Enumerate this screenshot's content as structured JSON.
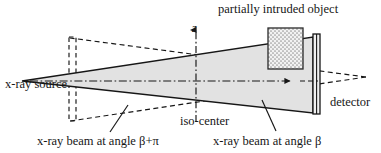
{
  "figure": {
    "width": 381,
    "height": 153,
    "background": "#ffffff",
    "stroke_color": "#161616",
    "fan_fill": "#e2e2e2",
    "object_fill": "#e6e6e6"
  },
  "labels": {
    "object": "partially intruded object",
    "source": "x-ray source",
    "detector": "detector",
    "iso_center": "iso-center",
    "beam_beta_plus_pi": "x-ray beam at angle β+π",
    "beam_beta": "x-ray beam at angle β",
    "z_axis": "z"
  },
  "geometry": {
    "source_point": [
      22,
      81
    ],
    "iso_center": [
      196,
      81
    ],
    "detector_bar": {
      "x": 313,
      "y": 34,
      "width": 7,
      "height": 80
    },
    "ghost_detector_bar": {
      "x": 69,
      "y": 37,
      "width": 7,
      "height": 84
    },
    "object_rect": {
      "x": 268,
      "y": 28,
      "width": 35,
      "height": 41
    },
    "fan_beta": {
      "apex": [
        22,
        81
      ],
      "top_far": [
        313,
        37
      ],
      "bottom_far": [
        313,
        113
      ]
    },
    "fan_beta_plus_pi": {
      "apex": [
        366,
        77
      ],
      "top_near": [
        70,
        38
      ],
      "bottom_near": [
        70,
        121
      ]
    },
    "z_axis": {
      "x": 196,
      "y_top": 24,
      "y_bottom": 122
    },
    "center_axis": {
      "y": 81,
      "x_start": 30,
      "x_end": 318,
      "arrow_x": 295
    }
  },
  "leader_lines": {
    "beta_plus_pi": [
      [
        110,
        132
      ],
      [
        128,
        105
      ]
    ],
    "beta": [
      [
        276,
        131
      ],
      [
        262,
        100
      ]
    ]
  }
}
